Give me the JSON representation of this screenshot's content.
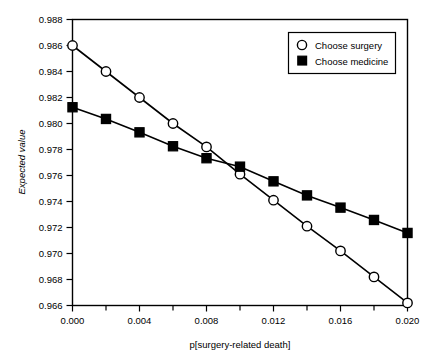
{
  "chart_data": {
    "type": "line",
    "title": "",
    "xlabel": "p[surgery-related death]",
    "ylabel": "Expected value",
    "xlim": [
      0.0,
      0.02
    ],
    "ylim": [
      0.966,
      0.988
    ],
    "grid": false,
    "legend_position": "top-right",
    "x": [
      0.0,
      0.002,
      0.004,
      0.006,
      0.008,
      0.01,
      0.012,
      0.014,
      0.016,
      0.018,
      0.02
    ],
    "xticks": [
      0.0,
      0.004,
      0.008,
      0.012,
      0.016,
      0.02
    ],
    "xtick_labels": [
      "0.000",
      "0.004",
      "0.008",
      "0.012",
      "0.016",
      "0.020"
    ],
    "xminorticks": [
      0.002,
      0.006,
      0.01,
      0.014,
      0.018
    ],
    "yticks": [
      0.966,
      0.968,
      0.97,
      0.972,
      0.974,
      0.976,
      0.978,
      0.98,
      0.982,
      0.984,
      0.986,
      0.988
    ],
    "ytick_labels": [
      "0.966",
      "0.968",
      "0.970",
      "0.972",
      "0.974",
      "0.976",
      "0.978",
      "0.980",
      "0.982",
      "0.984",
      "0.986",
      "0.988"
    ],
    "series": [
      {
        "name": "Choose surgery",
        "marker": "open-circle",
        "color": "#000000",
        "values": [
          0.986,
          0.984,
          0.982,
          0.98,
          0.9782,
          0.9761,
          0.9741,
          0.9721,
          0.9702,
          0.9682,
          0.9662
        ]
      },
      {
        "name": "Choose medicine",
        "marker": "filled-square",
        "color": "#000000",
        "values": [
          0.98125,
          0.98035,
          0.97932,
          0.97825,
          0.97733,
          0.97668,
          0.97555,
          0.97447,
          0.97353,
          0.97258,
          0.97158
        ]
      }
    ]
  },
  "legend": {
    "items": [
      {
        "label": "Choose surgery",
        "marker": "open-circle"
      },
      {
        "label": "Choose medicine",
        "marker": "filled-square"
      }
    ]
  }
}
